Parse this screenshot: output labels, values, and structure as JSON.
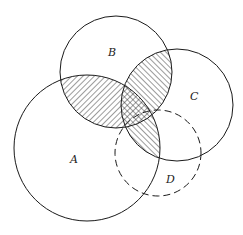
{
  "diagram": {
    "type": "venn",
    "sets": [
      {
        "id": "A",
        "label": "A",
        "outline": "solid"
      },
      {
        "id": "B",
        "label": "B",
        "outline": "solid"
      },
      {
        "id": "C",
        "label": "C",
        "outline": "solid"
      },
      {
        "id": "D",
        "label": "D",
        "outline": "dashed"
      }
    ],
    "shaded_regions": [
      {
        "region": "A∩B",
        "pattern": "diagonal-forward-hatch"
      },
      {
        "region": "B∩C",
        "pattern": "diagonal-back-hatch"
      },
      {
        "region": "A∩C",
        "pattern": "diagonal-back-hatch"
      },
      {
        "region": "A∩B∩C",
        "pattern": "cross-hatch"
      }
    ],
    "colors": {
      "stroke": "#1a1a1a",
      "background": "#ffffff"
    }
  }
}
